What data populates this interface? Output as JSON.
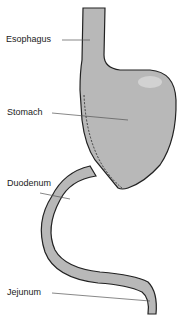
{
  "diagram": {
    "labels": {
      "esophagus": "Esophagus",
      "stomach": "Stomach",
      "duodenum": "Duodenum",
      "jejunum": "Jejunum"
    },
    "colors": {
      "organ_fill": "#b8b8b8",
      "highlight": "#d2d2d2",
      "outline": "#222222",
      "leader_line": "#555555",
      "background": "#ffffff"
    }
  }
}
